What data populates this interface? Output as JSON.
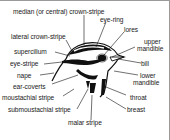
{
  "diagram": {
    "labels": {
      "median_crown_stripe": "median (or central) crown-stripe",
      "eye_ring": "eye-ring",
      "lores": "lores",
      "lateral_crown_stripe": "lateral crown-stripe",
      "upper_mandible_1": "upper",
      "upper_mandible_2": "mandible",
      "supercilium": "supercilium",
      "eye_stripe": "eye-stripe",
      "bill": "bill",
      "nape": "nape",
      "lower_mandible_1": "lower",
      "lower_mandible_2": "mandible",
      "ear_coverts": "ear-coverts",
      "moustachial_stripe": "moustachial stripe",
      "throat": "throat",
      "submoustachial_stripe": "submoustachial stripe",
      "breast": "breast",
      "malar_stripe": "malar stripe"
    }
  }
}
